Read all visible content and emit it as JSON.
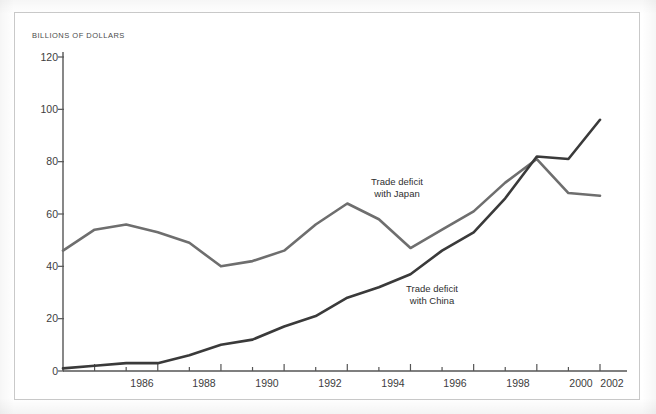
{
  "figure": {
    "y_axis_title": "BILLIONS OF DOLLARS",
    "frame_color": "#c9c9c9",
    "background": "#ffffff"
  },
  "chart_data": {
    "type": "line",
    "title": "",
    "subtitle": "",
    "xlabel": "",
    "ylabel": "BILLIONS OF DOLLARS",
    "xlim": [
      1985,
      2002
    ],
    "ylim": [
      0,
      120
    ],
    "yticks": [
      0,
      20,
      40,
      60,
      80,
      100,
      120
    ],
    "ytick_labels": [
      "0",
      "20",
      "40",
      "60",
      "80",
      "100",
      "120"
    ],
    "xticks": [
      1985,
      1986,
      1987,
      1988,
      1989,
      1990,
      1991,
      1992,
      1993,
      1994,
      1995,
      1996,
      1997,
      1998,
      1999,
      2000,
      2001,
      2002
    ],
    "xtick_labels_shown": [
      "1986",
      "1988",
      "1990",
      "1992",
      "1994",
      "1996",
      "1998",
      "2000",
      "2002"
    ],
    "xtick_label_years": [
      1986,
      1988,
      1990,
      1992,
      1994,
      1996,
      1998,
      2000,
      2002
    ],
    "grid": false,
    "legend_position": "inline-annotations",
    "x": [
      1985,
      1986,
      1987,
      1988,
      1989,
      1990,
      1991,
      1992,
      1993,
      1994,
      1995,
      1996,
      1997,
      1998,
      1999,
      2000,
      2001,
      2002
    ],
    "series": [
      {
        "name": "Trade deficit with Japan",
        "color": "#6e6e6e",
        "values": [
          46,
          54,
          56,
          53,
          49,
          40,
          42,
          46,
          56,
          64,
          58,
          47,
          54,
          61,
          72,
          81,
          68,
          67
        ]
      },
      {
        "name": "Trade deficit with China",
        "color": "#3a3a3a",
        "values": [
          1,
          2,
          3,
          3,
          6,
          10,
          12,
          17,
          21,
          28,
          32,
          37,
          46,
          53,
          66,
          82,
          81,
          96
        ]
      }
    ],
    "annotations": [
      {
        "name": "japan-series-label",
        "lines": [
          "Trade deficit",
          "with Japan"
        ],
        "series": "Trade deficit with Japan",
        "x": 1993.2,
        "y": 73
      },
      {
        "name": "china-series-label",
        "lines": [
          "Trade deficit",
          "with China"
        ],
        "series": "Trade deficit with China",
        "x": 1995.6,
        "y": 31
      }
    ]
  }
}
